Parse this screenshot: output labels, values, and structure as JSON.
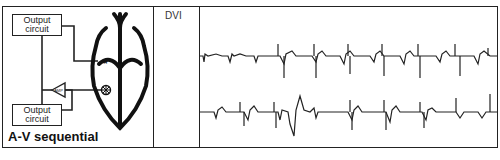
{
  "diagram": {
    "caption": "A-V sequential",
    "output_circuit_top": [
      "Output",
      "circuit"
    ],
    "output_circuit_bottom": [
      "Output",
      "circuit"
    ],
    "amp_label": "AMP",
    "atrial_marker": "*",
    "ventricular_marker": "⊛"
  },
  "mode": {
    "label": "DVI"
  },
  "ecg": {
    "strips": 2,
    "line_color": "#222222"
  }
}
